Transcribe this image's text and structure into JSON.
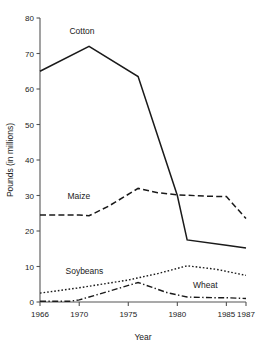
{
  "chart_data": {
    "type": "line",
    "title": "",
    "xlabel": "Year",
    "ylabel": "Pounds (in millions)",
    "xlim": [
      1966,
      1987
    ],
    "ylim": [
      0,
      80
    ],
    "ytick_values": [
      0,
      10,
      20,
      30,
      40,
      50,
      60,
      70,
      80
    ],
    "ytick_labels": [
      "0",
      "10",
      "20",
      "30",
      "40",
      "50",
      "60",
      "70",
      "80"
    ],
    "xtick_values": [
      1966,
      1970,
      1975,
      1980,
      1985,
      1987
    ],
    "xtick_labels": [
      "1966",
      "1970",
      "1975",
      "1980",
      "1985",
      "1987"
    ],
    "grid": false,
    "legend": "inline-labels",
    "series": [
      {
        "name": "Cotton",
        "style": "solid",
        "label_x": 1969.0,
        "label_y": 75.5,
        "x": [
          1966,
          1971,
          1976,
          1980,
          1981,
          1985,
          1987
        ],
        "values": [
          65,
          72,
          63.5,
          30,
          17.5,
          16,
          15.2
        ]
      },
      {
        "name": "Maize",
        "style": "dashed",
        "label_x": 1968.8,
        "label_y": 29.0,
        "x": [
          1966,
          1970,
          1971,
          1973,
          1976,
          1978,
          1980,
          1983,
          1985,
          1987
        ],
        "values": [
          24.5,
          24.5,
          24.3,
          27.0,
          32.0,
          30.8,
          30.2,
          29.8,
          29.7,
          23.5
        ]
      },
      {
        "name": "Soybeans",
        "style": "dotted",
        "label_x": 1968.6,
        "label_y": 7.8,
        "x": [
          1966,
          1970,
          1975,
          1978,
          1981,
          1984,
          1987
        ],
        "values": [
          2.5,
          4.0,
          6.2,
          8.0,
          10.2,
          9.2,
          7.5
        ]
      },
      {
        "name": "Wheat",
        "style": "dash-dot",
        "label_x": 1981.6,
        "label_y": 4.0,
        "x": [
          1966,
          1969,
          1970,
          1973,
          1976,
          1979,
          1981,
          1984,
          1985,
          1986,
          1987
        ],
        "values": [
          0.2,
          0.2,
          0.6,
          3.0,
          5.5,
          2.6,
          1.4,
          1.2,
          1.2,
          1.1,
          1.0
        ]
      }
    ]
  }
}
